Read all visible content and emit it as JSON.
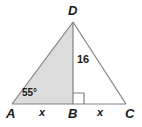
{
  "figure": {
    "type": "geometry-diagram",
    "shape": "isosceles-triangle-with-altitude",
    "width": 142,
    "height": 127,
    "background_color": "#ffffff",
    "stroke_color": "#808080",
    "shaded_fill_color": "#dcdcdc",
    "unshaded_fill_color": "#ffffff",
    "text_color": "#1a1a1a"
  },
  "vertices": {
    "A": {
      "label": "A",
      "x": 12,
      "y": 104
    },
    "B": {
      "label": "B",
      "x": 73,
      "y": 104
    },
    "C": {
      "label": "C",
      "x": 126,
      "y": 104
    },
    "D": {
      "label": "D",
      "x": 73,
      "y": 22
    }
  },
  "labels": {
    "angle_a": "55°",
    "altitude": "16",
    "segment_ab": "x",
    "segment_bc": "x"
  },
  "markers": {
    "right_angle_at_b": "right-angle-square"
  },
  "regions": [
    {
      "name": "triangle-abd",
      "shaded": true
    },
    {
      "name": "triangle-bdc",
      "shaded": false
    }
  ]
}
